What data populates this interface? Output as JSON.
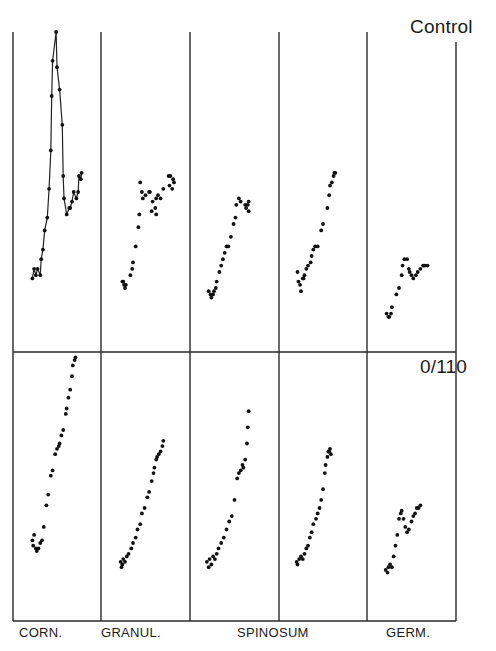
{
  "chart_data": {
    "type": "scatter",
    "title": "",
    "xlabel": "",
    "ylabel": "",
    "grid": false,
    "legend": "none",
    "layout": "2 rows x 5 columns of small-multiple panels; no axis ticks or numeric labels",
    "rows": [
      {
        "label": "Control"
      },
      {
        "label": "0/110"
      }
    ],
    "columns": [
      "CORN.",
      "GRANUL.",
      "SPINOSUM",
      "GERM."
    ],
    "column_label_note": "SPINOSUM spans columns 3 and 4 (two spinosum panels)",
    "panel_units": "x and y as 0-100 relative position within each panel (y = height above panel bottom)",
    "panels": [
      {
        "row": "Control",
        "column": "CORN.",
        "connected": true,
        "points": [
          [
            22,
            23
          ],
          [
            24,
            26
          ],
          [
            26,
            24
          ],
          [
            28,
            26
          ],
          [
            31,
            24
          ],
          [
            32,
            29
          ],
          [
            34,
            32
          ],
          [
            36,
            38
          ],
          [
            39,
            42
          ],
          [
            41,
            51
          ],
          [
            43,
            63
          ],
          [
            44,
            80
          ],
          [
            45,
            91
          ],
          [
            49,
            100
          ],
          [
            50,
            89
          ],
          [
            53,
            82
          ],
          [
            56,
            71
          ],
          [
            57,
            55
          ],
          [
            58,
            48
          ],
          [
            61,
            43
          ],
          [
            64,
            45
          ],
          [
            65,
            45
          ],
          [
            67,
            47
          ],
          [
            69,
            50
          ],
          [
            72,
            48
          ],
          [
            74,
            50
          ],
          [
            75,
            55
          ],
          [
            77,
            54
          ],
          [
            78,
            56
          ]
        ]
      },
      {
        "row": "Control",
        "column": "GRANUL.",
        "connected": false,
        "points": [
          [
            25,
            22
          ],
          [
            26,
            21
          ],
          [
            27,
            20
          ],
          [
            24,
            22
          ],
          [
            28,
            21
          ],
          [
            33,
            24
          ],
          [
            35,
            26
          ],
          [
            36,
            28
          ],
          [
            39,
            33
          ],
          [
            42,
            39
          ],
          [
            43,
            43
          ],
          [
            47,
            48
          ],
          [
            44,
            53
          ],
          [
            46,
            50
          ],
          [
            50,
            49
          ],
          [
            54,
            50
          ],
          [
            55,
            50
          ],
          [
            58,
            47
          ],
          [
            62,
            48
          ],
          [
            64,
            49
          ],
          [
            67,
            48
          ],
          [
            57,
            44
          ],
          [
            61,
            45
          ],
          [
            62,
            43
          ],
          [
            70,
            51
          ],
          [
            76,
            55
          ],
          [
            77,
            52
          ],
          [
            80,
            51
          ],
          [
            81,
            54
          ],
          [
            78,
            55
          ],
          [
            82,
            53
          ]
        ]
      },
      {
        "row": "Control",
        "column": "SPINOSUM-1",
        "connected": false,
        "points": [
          [
            21,
            19
          ],
          [
            23,
            18
          ],
          [
            24,
            17
          ],
          [
            26,
            18
          ],
          [
            27,
            19
          ],
          [
            29,
            20
          ],
          [
            30,
            22
          ],
          [
            33,
            25
          ],
          [
            35,
            27
          ],
          [
            37,
            29
          ],
          [
            39,
            31
          ],
          [
            41,
            33
          ],
          [
            43,
            33
          ],
          [
            46,
            36
          ],
          [
            49,
            40
          ],
          [
            51,
            42
          ],
          [
            52,
            46
          ],
          [
            55,
            48
          ],
          [
            57,
            47
          ],
          [
            62,
            46
          ],
          [
            63,
            45
          ],
          [
            65,
            46
          ],
          [
            66,
            44
          ],
          [
            66,
            47
          ]
        ]
      },
      {
        "row": "Control",
        "column": "SPINOSUM-2",
        "connected": false,
        "points": [
          [
            21,
            25
          ],
          [
            22,
            22
          ],
          [
            24,
            21
          ],
          [
            25,
            19
          ],
          [
            27,
            23
          ],
          [
            28,
            23
          ],
          [
            29,
            24
          ],
          [
            31,
            26
          ],
          [
            33,
            27
          ],
          [
            36,
            28
          ],
          [
            37,
            30
          ],
          [
            39,
            32
          ],
          [
            41,
            33
          ],
          [
            44,
            33
          ],
          [
            48,
            38
          ],
          [
            50,
            40
          ],
          [
            55,
            45
          ],
          [
            57,
            49
          ],
          [
            58,
            52
          ],
          [
            60,
            53
          ],
          [
            62,
            55
          ],
          [
            63,
            56
          ],
          [
            64,
            56
          ]
        ]
      },
      {
        "row": "Control",
        "column": "GERM.",
        "connected": false,
        "points": [
          [
            22,
            12
          ],
          [
            24,
            11
          ],
          [
            25,
            11
          ],
          [
            27,
            12
          ],
          [
            28,
            14
          ],
          [
            33,
            18
          ],
          [
            36,
            20
          ],
          [
            39,
            24
          ],
          [
            40,
            27
          ],
          [
            42,
            29
          ],
          [
            45,
            29
          ],
          [
            47,
            26
          ],
          [
            48,
            25
          ],
          [
            50,
            24
          ],
          [
            52,
            23
          ],
          [
            55,
            24
          ],
          [
            57,
            25
          ],
          [
            60,
            26
          ],
          [
            63,
            27
          ],
          [
            65,
            27
          ],
          [
            68,
            27
          ]
        ]
      },
      {
        "row": "0/110",
        "column": "CORN.",
        "connected": false,
        "points": [
          [
            22,
            30
          ],
          [
            23,
            28
          ],
          [
            24,
            32
          ],
          [
            26,
            27
          ],
          [
            27,
            26
          ],
          [
            29,
            27
          ],
          [
            31,
            29
          ],
          [
            33,
            30
          ],
          [
            35,
            35
          ],
          [
            38,
            43
          ],
          [
            40,
            47
          ],
          [
            43,
            54
          ],
          [
            45,
            56
          ],
          [
            48,
            62
          ],
          [
            50,
            64
          ],
          [
            52,
            65
          ],
          [
            53,
            66
          ],
          [
            55,
            69
          ],
          [
            57,
            71
          ],
          [
            60,
            77
          ],
          [
            61,
            79
          ],
          [
            63,
            83
          ],
          [
            65,
            86
          ],
          [
            67,
            91
          ],
          [
            68,
            95
          ],
          [
            70,
            97
          ],
          [
            71,
            98
          ]
        ]
      },
      {
        "row": "0/110",
        "column": "GRANUL.",
        "connected": false,
        "points": [
          [
            22,
            22
          ],
          [
            23,
            20
          ],
          [
            24,
            21
          ],
          [
            25,
            23
          ],
          [
            27,
            22
          ],
          [
            29,
            24
          ],
          [
            31,
            25
          ],
          [
            34,
            27
          ],
          [
            36,
            29
          ],
          [
            39,
            31
          ],
          [
            41,
            34
          ],
          [
            44,
            36
          ],
          [
            46,
            40
          ],
          [
            49,
            42
          ],
          [
            52,
            46
          ],
          [
            54,
            48
          ],
          [
            57,
            52
          ],
          [
            59,
            55
          ],
          [
            60,
            57
          ],
          [
            62,
            60
          ],
          [
            63,
            61
          ],
          [
            65,
            62
          ],
          [
            67,
            63
          ],
          [
            69,
            65
          ],
          [
            70,
            67
          ]
        ]
      },
      {
        "row": "0/110",
        "column": "SPINOSUM-1",
        "connected": false,
        "points": [
          [
            19,
            22
          ],
          [
            21,
            20
          ],
          [
            22,
            23
          ],
          [
            24,
            21
          ],
          [
            26,
            24
          ],
          [
            28,
            23
          ],
          [
            30,
            25
          ],
          [
            32,
            27
          ],
          [
            35,
            29
          ],
          [
            38,
            31
          ],
          [
            41,
            34
          ],
          [
            44,
            37
          ],
          [
            47,
            39
          ],
          [
            50,
            45
          ],
          [
            53,
            53
          ],
          [
            55,
            55
          ],
          [
            57,
            56
          ],
          [
            59,
            58
          ],
          [
            60,
            57
          ],
          [
            62,
            60
          ],
          [
            64,
            66
          ],
          [
            65,
            72
          ],
          [
            66,
            78
          ]
        ]
      },
      {
        "row": "0/110",
        "column": "SPINOSUM-2",
        "connected": false,
        "points": [
          [
            20,
            22
          ],
          [
            21,
            21
          ],
          [
            23,
            23
          ],
          [
            25,
            24
          ],
          [
            27,
            23
          ],
          [
            29,
            25
          ],
          [
            31,
            27
          ],
          [
            33,
            28
          ],
          [
            35,
            31
          ],
          [
            37,
            33
          ],
          [
            39,
            36
          ],
          [
            42,
            38
          ],
          [
            44,
            40
          ],
          [
            46,
            42
          ],
          [
            48,
            45
          ],
          [
            50,
            49
          ],
          [
            52,
            55
          ],
          [
            53,
            58
          ],
          [
            55,
            61
          ],
          [
            56,
            63
          ],
          [
            57,
            63
          ],
          [
            58,
            64
          ],
          [
            59,
            62
          ]
        ]
      },
      {
        "row": "0/110",
        "column": "GERM.",
        "connected": false,
        "points": [
          [
            21,
            19
          ],
          [
            23,
            18
          ],
          [
            24,
            20
          ],
          [
            26,
            21
          ],
          [
            28,
            20
          ],
          [
            30,
            24
          ],
          [
            32,
            28
          ],
          [
            34,
            32
          ],
          [
            36,
            38
          ],
          [
            38,
            40
          ],
          [
            39,
            41
          ],
          [
            41,
            38
          ],
          [
            43,
            35
          ],
          [
            45,
            33
          ],
          [
            47,
            34
          ],
          [
            50,
            37
          ],
          [
            52,
            39
          ],
          [
            54,
            40
          ],
          [
            56,
            42
          ],
          [
            58,
            42
          ],
          [
            60,
            43
          ]
        ]
      }
    ]
  },
  "frame": {
    "col_edges_px": [
      13,
      101,
      190,
      279,
      367,
      456
    ],
    "top_px": 32,
    "control_right_top_px": 42,
    "divider_px": 352,
    "bottom_px": 621
  },
  "labels": {
    "row_top": "Control",
    "row_bottom": "0/110",
    "col_corn": "CORN.",
    "col_granul": "GRANUL.",
    "col_spinosum": "SPINOSUM",
    "col_germ": "GERM."
  }
}
